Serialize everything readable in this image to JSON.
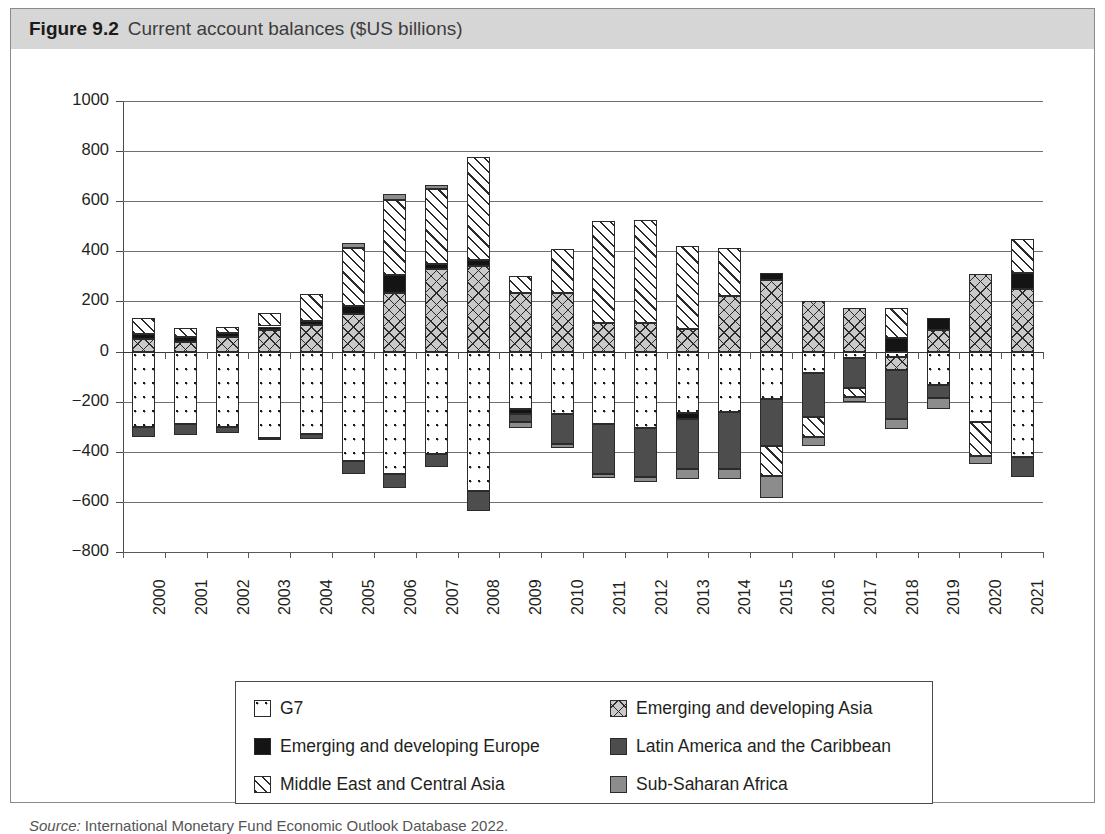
{
  "figure": {
    "label": "Figure 9.2",
    "title": "Current account balances ($US billions)",
    "source_prefix": "Source:",
    "source_text": "International Monetary Fund Economic Outlook Database 2022."
  },
  "legend": {
    "items": [
      {
        "key": "g7",
        "label": "G7",
        "pattern": "dotted-white"
      },
      {
        "key": "asia",
        "label": "Emerging and developing Asia",
        "pattern": "crosshatch-grey"
      },
      {
        "key": "europe",
        "label": "Emerging and developing Europe",
        "pattern": "solid-black"
      },
      {
        "key": "latam",
        "label": "Latin America and the Caribbean",
        "pattern": "solid-dark-grey"
      },
      {
        "key": "meca",
        "label": "Middle East and Central Asia",
        "pattern": "diagonal-hatch-white"
      },
      {
        "key": "ssa",
        "label": "Sub-Saharan Africa",
        "pattern": "solid-mid-grey"
      }
    ]
  },
  "chart_data": {
    "type": "bar",
    "stacked": true,
    "title": "Current account balances ($US billions)",
    "xlabel": "",
    "ylabel": "",
    "ylim": [
      -800,
      1000
    ],
    "ytick_step": 200,
    "yticks": [
      "1000",
      "800",
      "600",
      "400",
      "200",
      "0",
      "−200",
      "−400",
      "−600",
      "−800"
    ],
    "grid": true,
    "legend_position": "bottom",
    "categories": [
      "2000",
      "2001",
      "2002",
      "2003",
      "2004",
      "2005",
      "2006",
      "2007",
      "2008",
      "2009",
      "2010",
      "2011",
      "2012",
      "2013",
      "2014",
      "2015",
      "2016",
      "2017",
      "2018",
      "2019",
      "2020",
      "2021"
    ],
    "series": [
      {
        "name": "G7",
        "values": [
          -300,
          -290,
          -300,
          -345,
          -330,
          -435,
          -490,
          -410,
          -555,
          -230,
          -250,
          -290,
          -305,
          -245,
          -240,
          -190,
          -85,
          -25,
          -20,
          -135,
          -280,
          -200
        ]
      },
      {
        "name": "Emerging and developing Asia",
        "values": [
          50,
          40,
          60,
          85,
          105,
          150,
          235,
          330,
          340,
          175,
          185,
          100,
          85,
          75,
          95,
          215,
          170,
          130,
          55,
          75,
          310,
          250
        ]
      },
      {
        "name": "Emerging and developing Europe",
        "values": [
          20,
          20,
          15,
          12,
          12,
          30,
          -55,
          -55,
          -75,
          -15,
          -20,
          -30,
          -20,
          -40,
          -10,
          20,
          10,
          -20,
          -10,
          10,
          -10,
          65
        ]
      },
      {
        "name": "Latin America and the Caribbean",
        "values": [
          -40,
          -45,
          -25,
          -10,
          -20,
          -55,
          -55,
          -50,
          -80,
          -30,
          -75,
          -110,
          -125,
          -155,
          -165,
          -185,
          -175,
          -130,
          -135,
          -105,
          -5,
          -285
        ]
      },
      {
        "name": "Middle East and Central Asia",
        "values": [
          65,
          40,
          25,
          55,
          110,
          255,
          315,
          265,
          370,
          30,
          175,
          410,
          410,
          330,
          195,
          -120,
          -135,
          -35,
          120,
          30,
          -135,
          200
        ]
      },
      {
        "name": "Sub-Saharan Africa",
        "values": [
          10,
          5,
          5,
          5,
          5,
          15,
          10,
          5,
          5,
          -20,
          -15,
          -15,
          -20,
          -30,
          -40,
          -90,
          -50,
          -15,
          -40,
          -45,
          -30,
          -5
        ]
      }
    ]
  },
  "bars": [
    {
      "year": "2000",
      "pos": [
        {
          "s": "asia",
          "v": 50
        },
        {
          "s": "europe",
          "v": 20
        },
        {
          "s": "meca",
          "v": 65
        }
      ],
      "neg": [
        {
          "s": "g7",
          "v": -300
        },
        {
          "s": "latam",
          "v": -40
        }
      ]
    },
    {
      "year": "2001",
      "pos": [
        {
          "s": "asia",
          "v": 40
        },
        {
          "s": "europe",
          "v": 20
        },
        {
          "s": "meca",
          "v": 35
        }
      ],
      "neg": [
        {
          "s": "g7",
          "v": -290
        },
        {
          "s": "latam",
          "v": -45
        }
      ]
    },
    {
      "year": "2002",
      "pos": [
        {
          "s": "asia",
          "v": 60
        },
        {
          "s": "europe",
          "v": 15
        },
        {
          "s": "meca",
          "v": 25
        }
      ],
      "neg": [
        {
          "s": "g7",
          "v": -300
        },
        {
          "s": "latam",
          "v": -25
        }
      ]
    },
    {
      "year": "2003",
      "pos": [
        {
          "s": "asia",
          "v": 85
        },
        {
          "s": "europe",
          "v": 15
        },
        {
          "s": "meca",
          "v": 55
        }
      ],
      "neg": [
        {
          "s": "g7",
          "v": -345
        },
        {
          "s": "latam",
          "v": -10
        }
      ]
    },
    {
      "year": "2004",
      "pos": [
        {
          "s": "asia",
          "v": 105
        },
        {
          "s": "europe",
          "v": 15
        },
        {
          "s": "meca",
          "v": 110
        }
      ],
      "neg": [
        {
          "s": "g7",
          "v": -330
        },
        {
          "s": "latam",
          "v": -20
        }
      ]
    },
    {
      "year": "2005",
      "pos": [
        {
          "s": "asia",
          "v": 150
        },
        {
          "s": "europe",
          "v": 30
        },
        {
          "s": "meca",
          "v": 235
        },
        {
          "s": "ssa",
          "v": 20
        }
      ],
      "neg": [
        {
          "s": "g7",
          "v": -435
        },
        {
          "s": "latam",
          "v": -55
        }
      ]
    },
    {
      "year": "2006",
      "pos": [
        {
          "s": "asia",
          "v": 235
        },
        {
          "s": "europe",
          "v": 70
        },
        {
          "s": "meca",
          "v": 300
        },
        {
          "s": "ssa",
          "v": 25
        }
      ],
      "neg": [
        {
          "s": "g7",
          "v": -490
        },
        {
          "s": "latam",
          "v": -55
        }
      ]
    },
    {
      "year": "2007",
      "pos": [
        {
          "s": "asia",
          "v": 330
        },
        {
          "s": "europe",
          "v": 20
        },
        {
          "s": "meca",
          "v": 300
        },
        {
          "s": "ssa",
          "v": 15
        }
      ],
      "neg": [
        {
          "s": "g7",
          "v": -410
        },
        {
          "s": "latam",
          "v": -50
        }
      ]
    },
    {
      "year": "2008",
      "pos": [
        {
          "s": "asia",
          "v": 340
        },
        {
          "s": "europe",
          "v": 25
        },
        {
          "s": "meca",
          "v": 410
        }
      ],
      "neg": [
        {
          "s": "g7",
          "v": -555
        },
        {
          "s": "latam",
          "v": -80
        }
      ]
    },
    {
      "year": "2009",
      "pos": [
        {
          "s": "asia",
          "v": 235
        },
        {
          "s": "meca",
          "v": 65
        }
      ],
      "neg": [
        {
          "s": "g7",
          "v": -230
        },
        {
          "s": "europe",
          "v": -20
        },
        {
          "s": "latam",
          "v": -30
        },
        {
          "s": "ssa",
          "v": -25
        }
      ]
    },
    {
      "year": "2010",
      "pos": [
        {
          "s": "asia",
          "v": 235
        },
        {
          "s": "meca",
          "v": 175
        }
      ],
      "neg": [
        {
          "s": "g7",
          "v": -250
        },
        {
          "s": "latam",
          "v": -120
        },
        {
          "s": "ssa",
          "v": -15
        }
      ]
    },
    {
      "year": "2011",
      "pos": [
        {
          "s": "asia",
          "v": 115
        },
        {
          "s": "meca",
          "v": 405
        }
      ],
      "neg": [
        {
          "s": "g7",
          "v": -290
        },
        {
          "s": "latam",
          "v": -200
        },
        {
          "s": "ssa",
          "v": -15
        }
      ]
    },
    {
      "year": "2012",
      "pos": [
        {
          "s": "asia",
          "v": 115
        },
        {
          "s": "meca",
          "v": 410
        }
      ],
      "neg": [
        {
          "s": "g7",
          "v": -305
        },
        {
          "s": "latam",
          "v": -195
        },
        {
          "s": "ssa",
          "v": -20
        }
      ]
    },
    {
      "year": "2013",
      "pos": [
        {
          "s": "asia",
          "v": 90
        },
        {
          "s": "meca",
          "v": 330
        }
      ],
      "neg": [
        {
          "s": "g7",
          "v": -245
        },
        {
          "s": "europe",
          "v": -25
        },
        {
          "s": "latam",
          "v": -200
        },
        {
          "s": "ssa",
          "v": -40
        }
      ]
    },
    {
      "year": "2014",
      "pos": [
        {
          "s": "asia",
          "v": 220
        },
        {
          "s": "meca",
          "v": 195
        }
      ],
      "neg": [
        {
          "s": "g7",
          "v": -240
        },
        {
          "s": "latam",
          "v": -230
        },
        {
          "s": "ssa",
          "v": -40
        }
      ]
    },
    {
      "year": "2015",
      "pos": [
        {
          "s": "asia",
          "v": 285
        },
        {
          "s": "europe",
          "v": 30
        }
      ],
      "neg": [
        {
          "s": "g7",
          "v": -190
        },
        {
          "s": "latam",
          "v": -185
        },
        {
          "s": "meca",
          "v": -120
        },
        {
          "s": "ssa",
          "v": -90
        }
      ]
    },
    {
      "year": "2016",
      "pos": [
        {
          "s": "asia",
          "v": 200
        }
      ],
      "neg": [
        {
          "s": "g7",
          "v": -85
        },
        {
          "s": "latam",
          "v": -175
        },
        {
          "s": "meca",
          "v": -80
        },
        {
          "s": "ssa",
          "v": -35
        }
      ]
    },
    {
      "year": "2017",
      "pos": [
        {
          "s": "asia",
          "v": 175
        }
      ],
      "neg": [
        {
          "s": "g7",
          "v": -25
        },
        {
          "s": "latam",
          "v": -120
        },
        {
          "s": "meca",
          "v": -35
        },
        {
          "s": "ssa",
          "v": -20
        }
      ]
    },
    {
      "year": "2018",
      "pos": [
        {
          "s": "europe",
          "v": 55
        },
        {
          "s": "meca",
          "v": 120
        }
      ],
      "neg": [
        {
          "s": "g7",
          "v": -20
        },
        {
          "s": "asia",
          "v": -55
        },
        {
          "s": "latam",
          "v": -195
        },
        {
          "s": "ssa",
          "v": -40
        }
      ]
    },
    {
      "year": "2019",
      "pos": [
        {
          "s": "asia",
          "v": 85
        },
        {
          "s": "europe",
          "v": 50
        }
      ],
      "neg": [
        {
          "s": "g7",
          "v": -135
        },
        {
          "s": "latam",
          "v": -50
        },
        {
          "s": "ssa",
          "v": -45
        }
      ]
    },
    {
      "year": "2020",
      "pos": [
        {
          "s": "asia",
          "v": 310
        }
      ],
      "neg": [
        {
          "s": "g7",
          "v": -280
        },
        {
          "s": "meca",
          "v": -135
        },
        {
          "s": "ssa",
          "v": -35
        }
      ]
    },
    {
      "year": "2021",
      "pos": [
        {
          "s": "asia",
          "v": 250
        },
        {
          "s": "europe",
          "v": 65
        },
        {
          "s": "meca",
          "v": 135
        }
      ],
      "neg": [
        {
          "s": "g7",
          "v": -420
        },
        {
          "s": "latam",
          "v": -80
        }
      ]
    }
  ]
}
